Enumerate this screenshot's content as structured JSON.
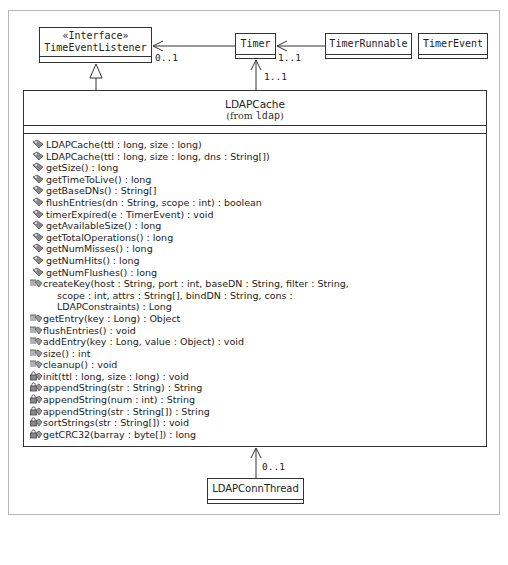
{
  "diagram": {
    "type": "UML class diagram",
    "classes": {
      "time_event_listener": {
        "stereotype": "«Interface»",
        "name": "TimeEventListener"
      },
      "timer": {
        "name": "Timer"
      },
      "timer_runnable": {
        "name": "TimerRunnable"
      },
      "timer_event": {
        "name": "TimerEvent"
      },
      "ldap_conn_thread": {
        "name": "LDAPConnThread"
      },
      "ldap_cache": {
        "name": "LDAPCache",
        "from_prefix": "(from ",
        "package": "ldap",
        "from_suffix": ")",
        "operations": [
          {
            "visibility": "public",
            "icon": "public-method-icon",
            "text": "LDAPCache(ttl : long, size : long)"
          },
          {
            "visibility": "public",
            "icon": "public-method-icon",
            "text": "LDAPCache(ttl : long, size : long, dns : String[])"
          },
          {
            "visibility": "public",
            "icon": "public-method-icon",
            "text": "getSize() : long"
          },
          {
            "visibility": "public",
            "icon": "public-method-icon",
            "text": "getTimeToLive() : long"
          },
          {
            "visibility": "public",
            "icon": "public-method-icon",
            "text": "getBaseDNs() : String[]"
          },
          {
            "visibility": "public",
            "icon": "public-method-icon",
            "text": "flushEntries(dn : String, scope : int) : boolean"
          },
          {
            "visibility": "public",
            "icon": "public-method-icon",
            "text": "timerExpired(e : TimerEvent) : void"
          },
          {
            "visibility": "public",
            "icon": "public-method-icon",
            "text": "getAvailableSize() : long"
          },
          {
            "visibility": "public",
            "icon": "public-method-icon",
            "text": "getTotalOperations() : long"
          },
          {
            "visibility": "public",
            "icon": "public-method-icon",
            "text": "getNumMisses() : long"
          },
          {
            "visibility": "public",
            "icon": "public-method-icon",
            "text": "getNumHits() : long"
          },
          {
            "visibility": "public",
            "icon": "public-method-icon",
            "text": "getNumFlushes() : long"
          },
          {
            "visibility": "package",
            "icon": "package-method-icon",
            "text": "createKey(host : String, port : int, baseDN : String, filter : String,"
          },
          {
            "visibility": "continuation",
            "icon": "",
            "text": "scope : int, attrs : String[], bindDN : String, cons :"
          },
          {
            "visibility": "continuation",
            "icon": "",
            "text": "LDAPConstraints) : Long"
          },
          {
            "visibility": "package",
            "icon": "package-method-icon",
            "text": "getEntry(key : Long) : Object"
          },
          {
            "visibility": "package",
            "icon": "package-method-icon",
            "text": "flushEntries() : void"
          },
          {
            "visibility": "package",
            "icon": "package-method-icon",
            "text": "addEntry(key : Long, value : Object) : void"
          },
          {
            "visibility": "package",
            "icon": "package-method-icon",
            "text": "size() : int"
          },
          {
            "visibility": "package",
            "icon": "package-method-icon",
            "text": "cleanup() : void"
          },
          {
            "visibility": "private",
            "icon": "private-method-icon",
            "text": "init(ttl : long, size : long) : void"
          },
          {
            "visibility": "private",
            "icon": "private-method-icon",
            "text": "appendString(str : String) : String"
          },
          {
            "visibility": "private",
            "icon": "private-method-icon",
            "text": "appendString(num : int) : String"
          },
          {
            "visibility": "private",
            "icon": "private-method-icon",
            "text": "appendString(str : String[]) : String"
          },
          {
            "visibility": "private",
            "icon": "private-method-icon",
            "text": "sortStrings(str : String[]) : void"
          },
          {
            "visibility": "private",
            "icon": "private-method-icon",
            "text": "getCRC32(barray : byte[]) : long"
          }
        ]
      }
    },
    "relationships": {
      "timer_to_listener": {
        "from": "Timer",
        "to": "TimeEventListener",
        "kind": "association",
        "multiplicity": "0..1"
      },
      "runnable_to_timer": {
        "from": "TimerRunnable",
        "to": "Timer",
        "kind": "association",
        "multiplicity": "1..1"
      },
      "cache_to_timer": {
        "from": "LDAPCache",
        "to": "Timer",
        "kind": "association",
        "multiplicity": "1..1"
      },
      "cache_realizes_listener": {
        "from": "LDAPCache",
        "to": "TimeEventListener",
        "kind": "generalization",
        "multiplicity": ""
      },
      "connthread_to_cache": {
        "from": "LDAPConnThread",
        "to": "LDAPCache",
        "kind": "association",
        "multiplicity": "0..1"
      }
    },
    "colors": {
      "line": "#333333",
      "frame": "#b8b8b8",
      "background": "#ffffff"
    }
  }
}
